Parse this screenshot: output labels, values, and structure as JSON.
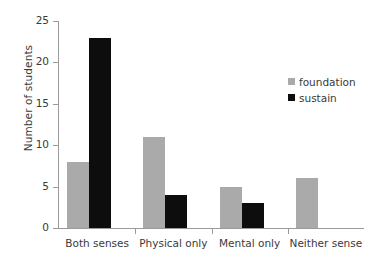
{
  "chart_data": {
    "type": "bar",
    "title": "",
    "xlabel": "",
    "ylabel": "Number of students",
    "categories": [
      "Both senses",
      "Physical only",
      "Mental only",
      "Neither sense"
    ],
    "series": [
      {
        "name": "foundation",
        "color": "#abaaaa",
        "values": [
          8,
          11,
          5,
          6
        ]
      },
      {
        "name": "sustain",
        "color": "#0d0d0d",
        "values": [
          23,
          4,
          3,
          0
        ]
      }
    ],
    "ylim": [
      0,
      25
    ],
    "yticks": [
      0,
      5,
      10,
      15,
      20,
      25
    ],
    "ytick_labels": [
      "0",
      "5",
      "10",
      "15",
      "20",
      "25"
    ],
    "grid": false,
    "legend_position": "upper right",
    "legend_entries": [
      "foundation",
      "sustain"
    ]
  },
  "axes": {
    "y_title": "Number of students"
  },
  "legend": {
    "items": [
      {
        "label": "foundation"
      },
      {
        "label": "sustain"
      }
    ]
  }
}
